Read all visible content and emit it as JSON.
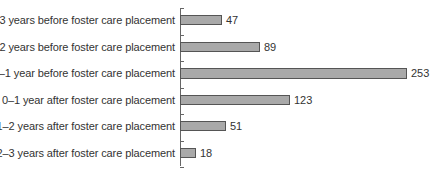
{
  "chart_data": {
    "type": "bar",
    "orientation": "horizontal",
    "title": "",
    "xlabel": "",
    "ylabel": "",
    "categories": [
      "2–3 years before foster care placement",
      "1–2 years before foster care placement",
      "0–1 year before foster care placement",
      "0–1 year after foster care placement",
      "1–2 years after foster care placement",
      "2–3 years after foster care placement"
    ],
    "values": [
      47,
      89,
      253,
      123,
      51,
      18
    ],
    "data_labels": [
      "47",
      "89",
      "253",
      "123",
      "51",
      "18"
    ],
    "xlim": [
      0,
      253
    ],
    "grid": false,
    "legend": null,
    "bar_color": "#a9a9a9",
    "bar_border_color": "#555555"
  }
}
